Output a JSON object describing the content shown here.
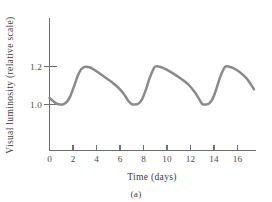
{
  "figure": {
    "caption": "(a)",
    "background_color": "#ffffff",
    "axis_color": "#6f6f6f",
    "text_color": "#3d3d3d"
  },
  "chart_data": {
    "type": "line",
    "title": "",
    "subtitle": "",
    "xlabel": "Time  (days)",
    "ylabel": "Visual luminosity (relative scale)",
    "caption": "(a)",
    "series": [
      {
        "name": "visual-luminosity",
        "color": "#8a8a8a",
        "line_width": 2.5,
        "x": [
          0.0,
          0.3,
          0.6,
          0.9,
          1.2,
          1.5,
          1.8,
          2.1,
          2.4,
          2.7,
          3.0,
          3.4,
          3.8,
          4.3,
          4.8,
          5.3,
          5.8,
          6.3,
          6.7,
          7.0,
          7.3,
          7.6,
          7.9,
          8.2,
          8.5,
          8.8,
          9.0,
          9.4,
          9.9,
          10.4,
          10.9,
          11.4,
          11.9,
          12.4,
          12.8,
          13.0,
          13.3,
          13.6,
          13.9,
          14.2,
          14.5,
          14.8,
          15.0,
          15.4,
          15.9,
          16.4,
          16.9,
          17.4
        ],
        "y": [
          1.035,
          1.018,
          1.005,
          1.0,
          1.002,
          1.015,
          1.048,
          1.098,
          1.15,
          1.185,
          1.198,
          1.196,
          1.183,
          1.162,
          1.14,
          1.118,
          1.092,
          1.058,
          1.02,
          1.002,
          1.0,
          1.006,
          1.03,
          1.078,
          1.135,
          1.18,
          1.2,
          1.199,
          1.186,
          1.168,
          1.148,
          1.126,
          1.1,
          1.062,
          1.022,
          1.003,
          1.0,
          1.006,
          1.032,
          1.082,
          1.14,
          1.184,
          1.2,
          1.197,
          1.183,
          1.16,
          1.128,
          1.08
        ]
      }
    ],
    "x_axis": {
      "label": "Time  (days)",
      "ticks": [
        0,
        2,
        4,
        6,
        8,
        10,
        12,
        14,
        16
      ],
      "tick_labels": [
        "0",
        "2",
        "4",
        "6",
        "8",
        "10",
        "12",
        "14",
        "16"
      ],
      "range": [
        0,
        17.9
      ],
      "grid": false
    },
    "y_axis": {
      "label": "Visual luminosity (relative scale)",
      "ticks": [
        1.0,
        1.2
      ],
      "tick_labels": [
        "1.0",
        "1.2"
      ],
      "range": [
        0.785,
        1.345
      ],
      "grid": false
    },
    "legend": {
      "visible": false,
      "position": "none",
      "entries": []
    },
    "annotations": [],
    "period_days": 6,
    "min_value": 1.0,
    "max_value": 1.2
  }
}
